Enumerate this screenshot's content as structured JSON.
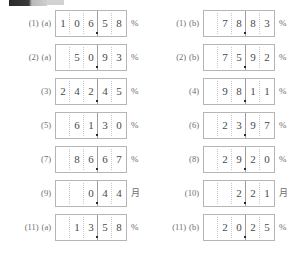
{
  "page": {
    "digit_count": 5,
    "decimal_after_digit": 3,
    "box_border_color": "#b5b5b5",
    "divider_dotted_color": "#c6c6c6",
    "divider_solid_color": "#9d9d9d",
    "label_color": "#6e6e6e",
    "digit_color": "#4a4a4a"
  },
  "artifact": {
    "name": "top-left-dark-bar"
  },
  "columns": [
    {
      "name": "left",
      "rows": [
        {
          "label_num": "(1)",
          "label_sub": "(a)",
          "digits": [
            "1",
            "0",
            "6",
            "5",
            "8"
          ],
          "unit": "%"
        },
        {
          "label_num": "(2)",
          "label_sub": "(a)",
          "digits": [
            "",
            "5",
            "0",
            "9",
            "3"
          ],
          "unit": "%"
        },
        {
          "label_num": "(3)",
          "label_sub": "",
          "digits": [
            "2",
            "4",
            "2",
            "4",
            "5"
          ],
          "unit": "%"
        },
        {
          "label_num": "(5)",
          "label_sub": "",
          "digits": [
            "",
            "6",
            "1",
            "3",
            "0"
          ],
          "unit": "%"
        },
        {
          "label_num": "(7)",
          "label_sub": "",
          "digits": [
            "",
            "8",
            "6",
            "6",
            "7"
          ],
          "unit": "%"
        },
        {
          "label_num": "(9)",
          "label_sub": "",
          "digits": [
            "",
            "",
            "0",
            "4",
            "4"
          ],
          "unit": "月"
        },
        {
          "label_num": "(11)",
          "label_sub": "(a)",
          "digits": [
            "",
            "1",
            "3",
            "5",
            "8"
          ],
          "unit": "%"
        }
      ]
    },
    {
      "name": "right",
      "rows": [
        {
          "label_num": "(1)",
          "label_sub": "(b)",
          "digits": [
            "",
            "7",
            "8",
            "8",
            "3"
          ],
          "unit": "%"
        },
        {
          "label_num": "(2)",
          "label_sub": "(b)",
          "digits": [
            "",
            "7",
            "5",
            "9",
            "2"
          ],
          "unit": "%"
        },
        {
          "label_num": "(4)",
          "label_sub": "",
          "digits": [
            "",
            "9",
            "8",
            "1",
            "1"
          ],
          "unit": "%"
        },
        {
          "label_num": "(6)",
          "label_sub": "",
          "digits": [
            "",
            "2",
            "3",
            "9",
            "7"
          ],
          "unit": "%"
        },
        {
          "label_num": "(8)",
          "label_sub": "",
          "digits": [
            "",
            "2",
            "9",
            "2",
            "0"
          ],
          "unit": "%"
        },
        {
          "label_num": "(10)",
          "label_sub": "",
          "digits": [
            "",
            "",
            "2",
            "2",
            "1"
          ],
          "unit": "月"
        },
        {
          "label_num": "(11)",
          "label_sub": "(b)",
          "digits": [
            "",
            "2",
            "0",
            "2",
            "5"
          ],
          "unit": "%"
        }
      ]
    }
  ]
}
